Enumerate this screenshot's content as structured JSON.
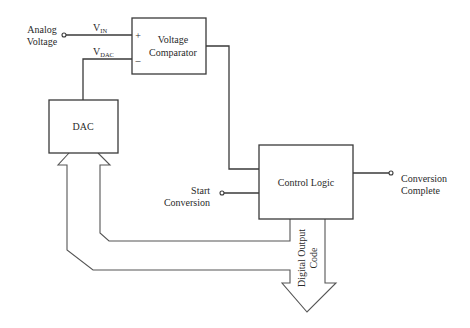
{
  "diagram": {
    "blocks": {
      "comparator": {
        "line1": "Voltage",
        "line2": "Comparator",
        "plus": "+",
        "minus": "–"
      },
      "dac": {
        "label": "DAC"
      },
      "control_logic": {
        "label": "Control Logic"
      }
    },
    "signals": {
      "vin": {
        "main": "V",
        "sub": "IN"
      },
      "vdac": {
        "main": "V",
        "sub": "DAC"
      }
    },
    "terminals": {
      "analog_voltage": {
        "line1": "Analog",
        "line2": "Voltage"
      },
      "start_conversion": {
        "line1": "Start",
        "line2": "Conversion"
      },
      "conversion_complete": {
        "line1": "Conversion",
        "line2": "Complete"
      }
    },
    "bus": {
      "digital_output": {
        "line1": "Digital Output",
        "line2": "Code"
      }
    },
    "colors": {
      "line": "#3a3a3a",
      "text": "#2a2a2a",
      "background": "#ffffff"
    }
  }
}
